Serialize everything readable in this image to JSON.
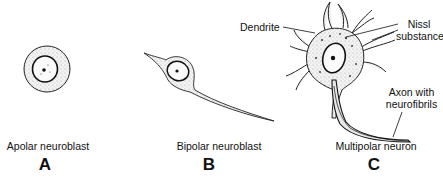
{
  "figure": {
    "panels": [
      {
        "id": "A",
        "caption": "Apolar neuroblast",
        "letter": "A"
      },
      {
        "id": "B",
        "caption": "Bipolar neuroblast",
        "letter": "B"
      },
      {
        "id": "C",
        "caption": "Multipolar neuron",
        "letter": "C",
        "labels": {
          "dendrite": "Dendrite",
          "nissl_line1": "Nissl",
          "nissl_line2": "substance",
          "axon_line1": "Axon with",
          "axon_line2": "neurofibrils"
        }
      }
    ],
    "colors": {
      "ink": "#111111",
      "stipple": "#e6e6e6",
      "background": "#ffffff"
    }
  }
}
